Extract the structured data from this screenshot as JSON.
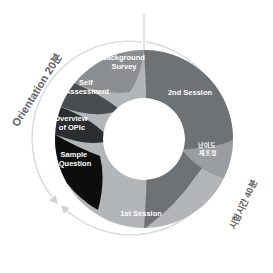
{
  "diagram": {
    "type": "donut",
    "center": {
      "x": 144,
      "y": 139
    },
    "inner_radius": 41,
    "outer_radius": 89,
    "arc_radius": 97,
    "background": "#ffffff"
  },
  "colors": {
    "sample_question": "#0d0d0d",
    "overview_opic": "#2b2d2f",
    "self_assessment": "#4a4d50",
    "background_survey": "#8c8f91",
    "second_session": "#6e7275",
    "first_session": "#b3b6b8",
    "difficulty_band": "#9a9d9f",
    "arc_line": "#d8dadb",
    "label_text": "#5f6366",
    "segment_text": "#ffffff"
  },
  "segments": [
    {
      "id": "background-survey",
      "label": "Background\nSurvey",
      "line1": "Background",
      "line2": "Survey",
      "color": "#8c8f91",
      "group": "orientation",
      "label_x": 124,
      "label_y": 64
    },
    {
      "id": "self-assessment",
      "label": "Self\nAssessment",
      "line1": "Self",
      "line2": "Assessment",
      "color": "#4a4d50",
      "group": "orientation",
      "label_x": 87,
      "label_y": 89
    },
    {
      "id": "overview-of-opic",
      "label": "Overview\nof OPIc",
      "line1": "Overview",
      "line2": "of OPIc",
      "color": "#2b2d2f",
      "group": "orientation",
      "label_x": 71,
      "label_y": 125
    },
    {
      "id": "sample-question",
      "label": "Sample\nQuestion",
      "line1": "Sample",
      "line2": "Question",
      "color": "#0d0d0d",
      "group": "orientation",
      "label_x": 74,
      "label_y": 161
    },
    {
      "id": "second-session",
      "label": "2nd Session",
      "line1": "2nd Session",
      "line2": "",
      "color": "#6e7275",
      "group": "test",
      "label_x": 190,
      "label_y": 93
    },
    {
      "id": "first-session",
      "label": "1st Session",
      "line1": "1st Session",
      "line2": "",
      "color": "#b3b6b8",
      "group": "test",
      "label_x": 141,
      "label_y": 214
    },
    {
      "id": "difficulty-readjust",
      "label": "난이도\n재조정",
      "line1": "난이도",
      "line2": "재조정",
      "color": "#9a9d9f",
      "group": "test",
      "label_x": 208,
      "label_y": 149
    }
  ],
  "outer_labels": [
    {
      "id": "orientation-duration",
      "text": "Orientation 20분",
      "side": "left",
      "color": "#5f6366"
    },
    {
      "id": "test-duration",
      "text": "시험시간 40분",
      "side": "right",
      "color": "#5f6366"
    }
  ],
  "annotations": {
    "top_divider": "vertical-tick-at-top-center",
    "arrows": [
      "orientation-arc-arrow",
      "test-arc-arrow"
    ]
  }
}
